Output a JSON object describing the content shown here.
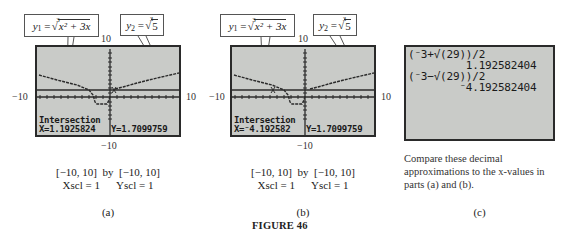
{
  "figure": {
    "title": "FIGURE 46"
  },
  "panels": [
    {
      "id": "a",
      "label": "(a)",
      "window": {
        "xmin_label": "−10",
        "xmax_label": "10",
        "ymax_label": "10",
        "ymin_label": "−10"
      },
      "callouts": {
        "y1": {
          "lhs": "y",
          "sub": "1",
          "eq": " = ",
          "index": "3",
          "radicand": "x² + 3x"
        },
        "y2": {
          "lhs": "y",
          "sub": "2",
          "eq": " = ",
          "index": "3",
          "radicand": "5"
        }
      },
      "screen": {
        "mode_text": "Intersection",
        "x_readout": "X=1.1925824",
        "y_readout": "Y=1.7099759"
      },
      "caption": {
        "line1": "[−10, 10]  by  [−10, 10]",
        "line2": "Xscl = 1      Yscl = 1"
      }
    },
    {
      "id": "b",
      "label": "(b)",
      "window": {
        "xmin_label": "−10",
        "xmax_label": "10",
        "ymax_label": "10",
        "ymin_label": "−10"
      },
      "callouts": {
        "y1": {
          "lhs": "y",
          "sub": "1",
          "eq": " = ",
          "index": "3",
          "radicand": "x² + 3x"
        },
        "y2": {
          "lhs": "y",
          "sub": "2",
          "eq": " = ",
          "index": "3",
          "radicand": "5"
        }
      },
      "screen": {
        "mode_text": "Intersection",
        "x_readout": "X=⁻4.192582",
        "y_readout": "Y=1.7099759"
      },
      "caption": {
        "line1": "[−10, 10]  by  [−10, 10]",
        "line2": "Xscl = 1      Yscl = 1"
      }
    },
    {
      "id": "c",
      "label": "(c)",
      "home_screen": {
        "lines": [
          "(⁻3+√(29))/2",
          "         1.192582404",
          "(⁻3−√(29))/2",
          "        ⁻4.192582404"
        ]
      },
      "note": "Compare these decimal approximations to the x-values in parts (a) and (b)."
    }
  ],
  "colors": {
    "screen_bg": "#c9cbc8",
    "screen_border": "#2a2a2a",
    "plot_ink": "#2b2b2b"
  }
}
